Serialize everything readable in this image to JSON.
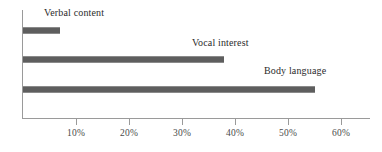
{
  "chart_data": {
    "type": "bar",
    "orientation": "horizontal",
    "title": "",
    "xlabel": "",
    "ylabel": "",
    "categories": [
      "Verbal content",
      "Vocal interest",
      "Body language"
    ],
    "values": [
      7,
      38,
      55
    ],
    "value_unit": "%",
    "xlim": [
      0,
      65
    ],
    "xticks": [
      10,
      20,
      30,
      40,
      50,
      60
    ],
    "xtick_labels": [
      "10%",
      "20%",
      "30%",
      "40%",
      "50%",
      "60%"
    ],
    "grid": false,
    "legend": false,
    "series": [
      {
        "name": "Share of communication impact",
        "values": [
          7,
          38,
          55
        ]
      }
    ],
    "bar_color": "#5e5e5e",
    "axis_color": "#9a9a9a",
    "text_color": "#2b2b2b"
  },
  "bars": [
    {
      "label": "Verbal content",
      "value": 7,
      "value_label": "7%"
    },
    {
      "label": "Vocal interest",
      "value": 38,
      "value_label": "38%"
    },
    {
      "label": "Body language",
      "value": 55,
      "value_label": "55%"
    }
  ],
  "axis": {
    "ticks": [
      {
        "label": "10%",
        "value": 10
      },
      {
        "label": "20%",
        "value": 20
      },
      {
        "label": "30%",
        "value": 30
      },
      {
        "label": "40%",
        "value": 40
      },
      {
        "label": "50%",
        "value": 50
      },
      {
        "label": "60%",
        "value": 60
      }
    ]
  }
}
